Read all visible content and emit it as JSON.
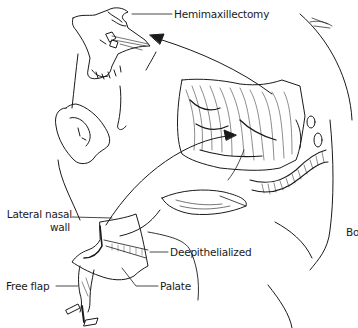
{
  "figure": {
    "type": "medical-illustration"
  },
  "labels": {
    "hemimaxillectomy": "Hemimaxillectomy",
    "lateral_nasal_wall_line1": "Lateral nasal",
    "lateral_nasal_wall_line2": "wall",
    "deepithelialized": "Deepithelialized",
    "palate": "Palate",
    "free_flap": "Free flap",
    "cropped_right": "Bo"
  },
  "colors": {
    "ink": "#1a1a1a",
    "background": "#ffffff"
  }
}
